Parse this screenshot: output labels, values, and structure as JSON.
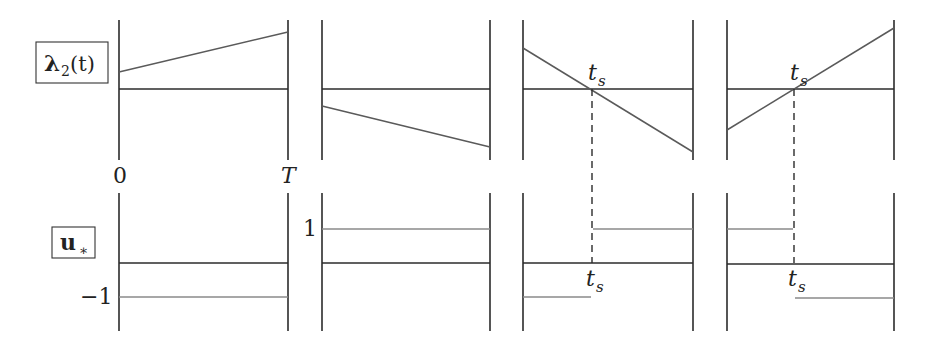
{
  "row_labels": {
    "top": {
      "main": "λ",
      "sub": "2",
      "arg": "(t)"
    },
    "bottom": {
      "main": "u",
      "sub": "∗"
    }
  },
  "axis_labels": {
    "t0": "0",
    "tT": "T"
  },
  "level_labels": {
    "plus_one": "1",
    "minus_one": "−1"
  },
  "switch_label": {
    "main": "t",
    "sub": "s"
  },
  "panels": [
    {
      "id": 1,
      "case": "λ2 > 0 on [0,T]",
      "lambda": {
        "start": "positive",
        "end": "positive, increasing"
      },
      "u": "−1 throughout",
      "switch": false
    },
    {
      "id": 2,
      "case": "λ2 < 0 on [0,T]",
      "lambda": {
        "start": "negative",
        "end": "negative, decreasing"
      },
      "u": "1 throughout",
      "switch": false
    },
    {
      "id": 3,
      "case": "λ2 decreasing, crosses zero at t_s",
      "lambda": {
        "start": "positive",
        "end": "negative"
      },
      "u": "−1 before t_s, 1 after t_s",
      "switch": true
    },
    {
      "id": 4,
      "case": "λ2 increasing, crosses zero at t_s",
      "lambda": {
        "start": "negative",
        "end": "positive"
      },
      "u": "1 before t_s, −1 after t_s",
      "switch": true
    }
  ],
  "colors": {
    "axis": "#2b2b2b",
    "lambda": "#5a5a5a",
    "control": "#8a8a8a",
    "background": "#ffffff"
  }
}
